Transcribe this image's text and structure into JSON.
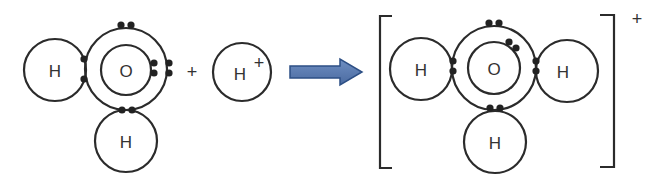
{
  "diagram": {
    "reactants": {
      "water": {
        "atoms": [
          {
            "symbol": "H",
            "role": "hydrogen-left"
          },
          {
            "symbol": "O",
            "role": "oxygen"
          },
          {
            "symbol": "H",
            "role": "hydrogen-bottom"
          }
        ]
      },
      "plus": "+",
      "proton": {
        "symbol": "H",
        "charge": "+"
      }
    },
    "arrow": {
      "color": "#4a6fa5",
      "stroke": "#2d4f85"
    },
    "product": {
      "atoms": [
        {
          "symbol": "H",
          "role": "hydrogen-left"
        },
        {
          "symbol": "O",
          "role": "oxygen"
        },
        {
          "symbol": "H",
          "role": "hydrogen-right"
        },
        {
          "symbol": "H",
          "role": "hydrogen-bottom"
        }
      ],
      "charge": "+"
    }
  }
}
